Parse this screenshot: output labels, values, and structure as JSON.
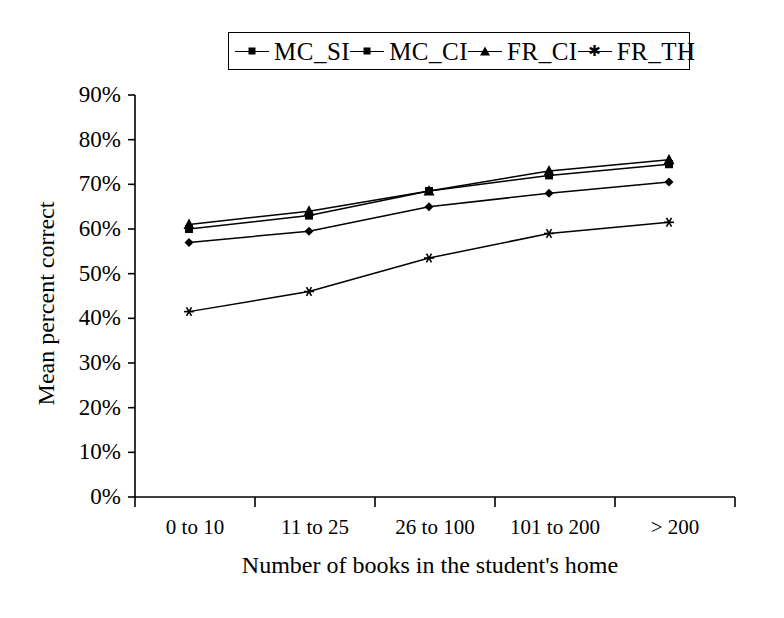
{
  "chart_data": {
    "type": "line",
    "title": "",
    "xlabel": "Number of books in the student's home",
    "ylabel": "Mean percent correct",
    "categories": [
      "0 to 10",
      "11 to 25",
      "26 to 100",
      "101 to 200",
      "> 200"
    ],
    "ylim": [
      0,
      90
    ],
    "ytick_labels": [
      "90%",
      "80%",
      "70%",
      "60%",
      "50%",
      "40%",
      "30%",
      "20%",
      "10%",
      "0%"
    ],
    "ytick_values": [
      90,
      80,
      70,
      60,
      50,
      40,
      30,
      20,
      10,
      0
    ],
    "grid": false,
    "legend_position": "top-center",
    "series": [
      {
        "name": "MC_SI",
        "marker": "diamond",
        "color": "#000000",
        "values": [
          57.0,
          59.5,
          65.0,
          68.0,
          70.5
        ]
      },
      {
        "name": "MC_CI",
        "marker": "square",
        "color": "#000000",
        "values": [
          60.0,
          63.0,
          68.5,
          72.0,
          74.5
        ]
      },
      {
        "name": "FR_CI",
        "marker": "triangle",
        "color": "#000000",
        "values": [
          61.0,
          64.0,
          68.5,
          73.0,
          75.5
        ]
      },
      {
        "name": "FR_TH",
        "marker": "star",
        "color": "#000000",
        "values": [
          41.5,
          46.0,
          53.5,
          59.0,
          61.5
        ]
      }
    ]
  },
  "legend": {
    "entries": [
      {
        "label": "MC_SI",
        "marker": "diamond"
      },
      {
        "label": "MC_CI",
        "marker": "square"
      },
      {
        "label": "FR_CI",
        "marker": "triangle"
      },
      {
        "label": "FR_TH",
        "marker": "star"
      }
    ]
  },
  "axes": {
    "y_title": "Mean percent correct",
    "x_title": "Number of books in the student's home"
  },
  "colors": {
    "line": "#000000",
    "axis": "#000000",
    "background": "#ffffff"
  }
}
